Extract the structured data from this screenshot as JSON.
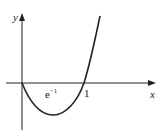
{
  "figure": {
    "function": "y = x ln x",
    "axes": {
      "x_label": "x",
      "y_label": "y"
    },
    "annotations": {
      "min_x_label": "e",
      "min_x_exp": "−1",
      "root_label": "1"
    },
    "colors": {
      "curve": "#222222",
      "axes": "#222222",
      "background": "#ffffff"
    }
  }
}
